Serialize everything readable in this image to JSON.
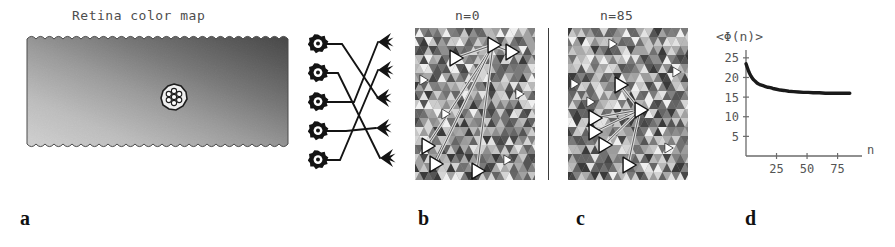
{
  "figure": {
    "panels": [
      {
        "id": "a",
        "letter": "a",
        "title": "Retina color map",
        "description": "retina-color-map-gradient"
      },
      {
        "id": "b",
        "letter": "b",
        "title": "n=0",
        "description": "cortical-mosaic-initial"
      },
      {
        "id": "c",
        "letter": "c",
        "title": "n=85",
        "description": "cortical-mosaic-converged"
      },
      {
        "id": "d",
        "letter": "d",
        "title": "",
        "description": "convergence-plot"
      }
    ]
  },
  "panel_a": {
    "title": "Retina color map",
    "gradient": {
      "dark_corner": "top-right",
      "light_corner": "bottom-left",
      "dark_color": "#2e2e2e",
      "light_color": "#f2f2f2"
    },
    "cluster": {
      "name": "receptive-field-cluster",
      "cell_count": 7,
      "arrangement": "hexagonal",
      "cell_color": "#ffffff",
      "outline_color": "#1a1a1a"
    }
  },
  "panel_wiring": {
    "name": "retino-cortical-wiring-diagram",
    "receptor_count": 5,
    "target_count": 5,
    "receptor_icon": "rosette-receptor-icon",
    "target_icon": "arrow-neuron-icon",
    "line_color": "#111111",
    "connections": [
      {
        "from": 0,
        "to": 2
      },
      {
        "from": 1,
        "to": 4
      },
      {
        "from": 2,
        "to": 0
      },
      {
        "from": 3,
        "to": 3
      },
      {
        "from": 4,
        "to": 1
      }
    ]
  },
  "panel_b": {
    "title": "n=0",
    "marker_count": 6,
    "hub_index": 0,
    "marker_color": "#ffffff",
    "marker_outline": "#111111",
    "link_color": "#dcdcdc",
    "markers": [
      {
        "x": 78,
        "y": 17,
        "name": "hub"
      },
      {
        "x": 96,
        "y": 24,
        "name": "node-1"
      },
      {
        "x": 40,
        "y": 30,
        "name": "node-2"
      },
      {
        "x": 12,
        "y": 118,
        "name": "node-3"
      },
      {
        "x": 20,
        "y": 136,
        "name": "node-4"
      },
      {
        "x": 62,
        "y": 143,
        "name": "node-5"
      }
    ]
  },
  "panel_c": {
    "title": "n=85",
    "marker_count": 6,
    "hub_index": 0,
    "marker_color": "#ffffff",
    "marker_outline": "#111111",
    "link_color": "#dcdcdc",
    "markers": [
      {
        "x": 72,
        "y": 82,
        "name": "hub"
      },
      {
        "x": 52,
        "y": 57,
        "name": "node-1"
      },
      {
        "x": 26,
        "y": 90,
        "name": "node-2"
      },
      {
        "x": 26,
        "y": 104,
        "name": "node-3"
      },
      {
        "x": 36,
        "y": 117,
        "name": "node-4"
      },
      {
        "x": 60,
        "y": 137,
        "name": "node-5"
      }
    ]
  },
  "chart_data": {
    "type": "line",
    "title": "",
    "ylabel": "<Φ(n)>",
    "xlabel": "n",
    "xlim": [
      0,
      95
    ],
    "ylim": [
      0,
      27
    ],
    "yticks": [
      5,
      10,
      15,
      20,
      25
    ],
    "xticks": [
      25,
      50,
      75
    ],
    "grid": false,
    "legend": "none",
    "line_color": "#1a1a1a",
    "x": [
      0,
      1,
      2,
      3,
      4,
      5,
      6,
      7,
      8,
      9,
      10,
      12,
      14,
      16,
      18,
      20,
      22,
      25,
      28,
      31,
      35,
      39,
      43,
      47,
      51,
      55,
      60,
      65,
      70,
      75,
      80,
      85
    ],
    "y": [
      23.5,
      22.6,
      21.7,
      21.0,
      20.4,
      19.9,
      19.5,
      19.2,
      18.9,
      18.6,
      18.4,
      18.1,
      17.9,
      17.7,
      17.5,
      17.4,
      17.2,
      17.0,
      16.8,
      16.7,
      16.5,
      16.4,
      16.3,
      16.2,
      16.2,
      16.1,
      16.1,
      16.0,
      16.0,
      16.0,
      16.0,
      16.0
    ]
  }
}
